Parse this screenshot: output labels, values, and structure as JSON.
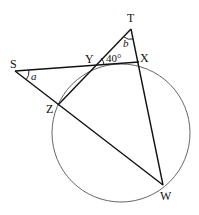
{
  "figure": {
    "points": {
      "S": {
        "label": "S",
        "x": 15,
        "y": 71
      },
      "Y": {
        "label": "Y",
        "x": 93,
        "y": 66
      },
      "X": {
        "label": "X",
        "x": 139,
        "y": 62
      },
      "T": {
        "label": "T",
        "x": 131,
        "y": 29
      },
      "Z": {
        "label": "Z",
        "x": 58,
        "y": 105
      },
      "W": {
        "label": "W",
        "x": 163,
        "y": 185
      }
    },
    "circle": {
      "cx": 121,
      "cy": 133,
      "r": 69
    },
    "angle_labels": {
      "a": "a",
      "b": "b",
      "yangle": "40°"
    }
  }
}
